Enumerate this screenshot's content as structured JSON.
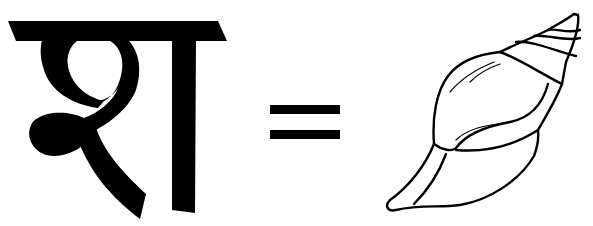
{
  "equation": {
    "letter": {
      "glyph": "श",
      "script": "Devanagari",
      "color": "#000000"
    },
    "operator": "=",
    "picture": {
      "icon": "conch-shell-icon",
      "stroke_color": "#000000",
      "fill_color": "#ffffff"
    }
  }
}
